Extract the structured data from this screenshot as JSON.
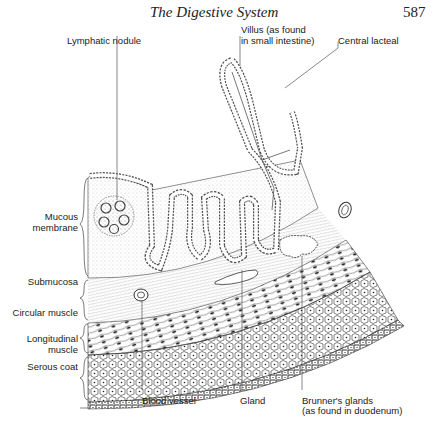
{
  "header": {
    "title": "The Digestive System",
    "page_number": "587"
  },
  "figure": {
    "top_labels": {
      "lymphatic_nodule": "Lymphatic nodule",
      "villus_line1": "Villus (as found",
      "villus_line2": "in small intestine)",
      "central_lacteal": "Central lacteal"
    },
    "layer_labels": {
      "mucous_line1": "Mucous",
      "mucous_line2": "membrane",
      "submucosa": "Submucosa",
      "circular_muscle": "Circular muscle",
      "longitudinal_line1": "Longitudinal",
      "longitudinal_line2": "muscle",
      "serous_coat": "Serous coat"
    },
    "bottom_labels": {
      "blood_vessel": "Blood vessel",
      "gland": "Gland",
      "brunners_line1": "Brunner's glands",
      "brunners_line2": "(as found in duodenum)"
    }
  }
}
